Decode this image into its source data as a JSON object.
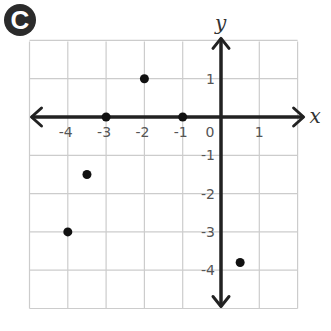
{
  "badge": {
    "label": "C",
    "color": "#2b2b2b"
  },
  "chart_data": {
    "type": "scatter",
    "title": "",
    "xlabel": "x",
    "ylabel": "y",
    "xlim": [
      -5,
      2
    ],
    "ylim": [
      -5,
      2
    ],
    "grid": true,
    "x_ticks": [
      -4,
      -3,
      -2,
      -1,
      0,
      1
    ],
    "x_tick_labels": [
      "-4",
      "-3",
      "-2",
      "-1",
      "0",
      "1"
    ],
    "y_ticks": [
      1,
      -1,
      -2,
      -3,
      -4
    ],
    "y_tick_labels": [
      "1",
      "-1",
      "-2",
      "-3",
      "-4"
    ],
    "points": [
      {
        "x": -2,
        "y": 1
      },
      {
        "x": -3,
        "y": 0
      },
      {
        "x": -1,
        "y": 0
      },
      {
        "x": -3.5,
        "y": -1.5
      },
      {
        "x": -4,
        "y": -3
      },
      {
        "x": 0.5,
        "y": -3.8
      }
    ],
    "colors": {
      "grid": "#cccccc",
      "axis": "#222222",
      "point": "#111111",
      "text": "#555555"
    }
  }
}
